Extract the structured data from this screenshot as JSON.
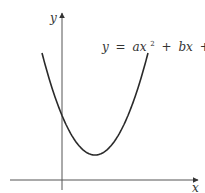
{
  "figure": {
    "type": "diagram",
    "x_axis_label": "x",
    "y_axis_label": "y",
    "equation": {
      "lhs": "y",
      "eq": "=",
      "a_term": "ax",
      "exponent": "2",
      "plus1": "+",
      "b_term": "bx",
      "plus2": "+",
      "c_term": "c"
    },
    "curve": {
      "shape": "parabola opening upward",
      "vertex_quadrant": "right of y-axis, above x-axis",
      "y_intercept": "positive",
      "color": "#2a2a2a"
    },
    "axis_color": "#555555"
  }
}
